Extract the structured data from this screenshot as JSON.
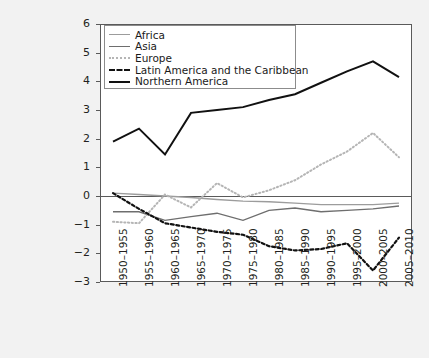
{
  "chart_data": {
    "type": "line",
    "title": "",
    "xlabel": "",
    "ylabel": "",
    "ylim": [
      -3,
      6
    ],
    "yticks": [
      6,
      5,
      4,
      3,
      2,
      1,
      0,
      -1,
      -2,
      -3
    ],
    "ytick_labels": [
      "6",
      "5",
      "4",
      "3",
      "2",
      "1",
      "0",
      "−1",
      "−2",
      "−3"
    ],
    "grid": false,
    "legend_position": "upper-left-inside",
    "categories": [
      "1950–1955",
      "1955–1960",
      "1960–1965",
      "1965–1970",
      "1970–1975",
      "1975–1980",
      "1980–1985",
      "1985–1990",
      "1990–1995",
      "1995–2000",
      "2000–2005",
      "2005–2010"
    ],
    "series": [
      {
        "name": "Africa",
        "color": "#9c9c9c",
        "dash": "solid",
        "width": 1.4,
        "values": [
          0.1,
          0.05,
          0.0,
          -0.05,
          -0.12,
          -0.18,
          -0.2,
          -0.25,
          -0.3,
          -0.3,
          -0.3,
          -0.25
        ]
      },
      {
        "name": "Asia",
        "color": "#6e6e6e",
        "dash": "solid",
        "width": 1.4,
        "values": [
          -0.55,
          -0.55,
          -0.85,
          -0.72,
          -0.6,
          -0.85,
          -0.5,
          -0.42,
          -0.55,
          -0.5,
          -0.45,
          -0.35
        ]
      },
      {
        "name": "Europe",
        "color": "#b5b5b5",
        "dash": "dotted",
        "width": 2.0,
        "values": [
          -0.9,
          -0.95,
          0.05,
          -0.4,
          0.45,
          -0.05,
          0.2,
          0.55,
          1.1,
          1.55,
          2.2,
          1.35
        ]
      },
      {
        "name": "Latin America and the Caribbean",
        "color": "#111111",
        "dash": "dashed",
        "width": 2.2,
        "values": [
          0.1,
          -0.45,
          -0.95,
          -1.1,
          -1.25,
          -1.35,
          -1.75,
          -1.9,
          -1.85,
          -1.65,
          -2.6,
          -1.45
        ]
      },
      {
        "name": "Northern America",
        "color": "#111111",
        "dash": "solid",
        "width": 2.0,
        "values": [
          1.9,
          2.35,
          1.45,
          2.9,
          3.0,
          3.1,
          3.35,
          3.55,
          3.95,
          4.35,
          4.7,
          4.15
        ]
      }
    ]
  },
  "legend": {
    "items": [
      {
        "label": "Africa"
      },
      {
        "label": "Asia"
      },
      {
        "label": "Europe"
      },
      {
        "label": "Latin America and the Caribbean"
      },
      {
        "label": "Northern America"
      }
    ]
  }
}
